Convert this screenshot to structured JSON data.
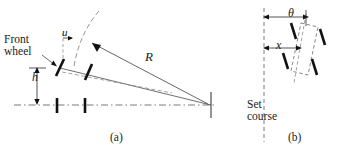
{
  "figure": {
    "colors": {
      "ink": "#1a1a1a",
      "line": "#3a3a3a",
      "dashed": "#6b6b6b",
      "background": "#ffffff"
    },
    "panels": [
      {
        "id": "a",
        "caption": "(a)",
        "labels": {
          "front_wheel_line1": "Front",
          "front_wheel_line2": "wheel",
          "steer_angle": "u",
          "offset_height": "h",
          "turn_radius": "R"
        }
      },
      {
        "id": "b",
        "caption": "(b)",
        "labels": {
          "heading_angle": "θ",
          "lateral_offset": "x",
          "set_course_line1": "Set",
          "set_course_line2": "course"
        }
      }
    ]
  }
}
